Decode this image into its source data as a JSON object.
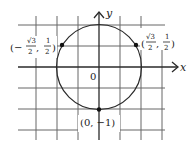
{
  "diagram": {
    "title": "",
    "axes": {
      "x_label": "x",
      "y_label": "y",
      "origin_label": "0"
    },
    "circle": {
      "center": [
        0,
        0
      ],
      "radius": 1
    },
    "points": [
      {
        "label": "(−√3/2, 1/2)",
        "x": -0.866,
        "y": 0.5
      },
      {
        "label": "(√3/2, 1/2)",
        "x": 0.866,
        "y": 0.5
      },
      {
        "label": "(0, −1)",
        "x": 0,
        "y": -1
      }
    ],
    "point_labels": {
      "left_open": "(−",
      "left_close": ", ",
      "right_open": "(",
      "bottom": "(0, −1)",
      "num_sqrt3": "√3",
      "den_2": "2",
      "num_1": "1"
    },
    "colors": {
      "line": "#2a2a2a",
      "grid": "#5a5a5a",
      "background": "#ffffff"
    }
  }
}
